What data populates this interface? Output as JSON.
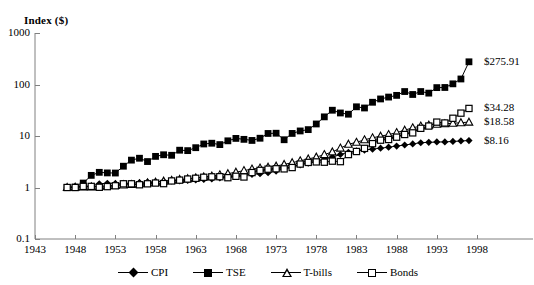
{
  "chart_data": {
    "type": "line",
    "title": "",
    "ylabel": "Index ($)",
    "xlabel": "",
    "log_y": true,
    "ylim": [
      0.1,
      1000
    ],
    "xlim": [
      1943,
      1998
    ],
    "ytick_labels": [
      "1000",
      "100",
      "10",
      "1",
      "0.1"
    ],
    "ytick_values": [
      1000,
      100,
      10,
      1,
      0.1
    ],
    "xtick_labels": [
      "1943",
      "1948",
      "1953",
      "1958",
      "1963",
      "1968",
      "1973",
      "1978",
      "1983",
      "1988",
      "1993",
      "1998"
    ],
    "xtick_values": [
      1943,
      1948,
      1953,
      1958,
      1963,
      1968,
      1973,
      1978,
      1983,
      1988,
      1993,
      1998
    ],
    "grid": false,
    "legend_position": "bottom",
    "x": [
      1947,
      1948,
      1949,
      1950,
      1951,
      1952,
      1953,
      1954,
      1955,
      1956,
      1957,
      1958,
      1959,
      1960,
      1961,
      1962,
      1963,
      1964,
      1965,
      1966,
      1967,
      1968,
      1969,
      1970,
      1971,
      1972,
      1973,
      1974,
      1975,
      1976,
      1977,
      1978,
      1979,
      1980,
      1981,
      1982,
      1983,
      1984,
      1985,
      1986,
      1987,
      1988,
      1989,
      1990,
      1991,
      1992,
      1993,
      1994,
      1995,
      1996,
      1997
    ],
    "series": [
      {
        "name": "CPI",
        "marker": "filled-diamond",
        "end_label": "$8.16",
        "end_value": 8.16,
        "values": [
          1.0,
          1.04,
          1.05,
          1.07,
          1.18,
          1.21,
          1.2,
          1.21,
          1.21,
          1.25,
          1.28,
          1.3,
          1.32,
          1.34,
          1.35,
          1.37,
          1.4,
          1.43,
          1.47,
          1.53,
          1.59,
          1.66,
          1.74,
          1.8,
          1.85,
          1.94,
          2.08,
          2.31,
          2.55,
          2.74,
          2.96,
          3.23,
          3.53,
          3.89,
          4.37,
          4.84,
          5.12,
          5.34,
          5.56,
          5.8,
          6.06,
          6.36,
          6.68,
          7.01,
          7.4,
          7.52,
          7.66,
          7.67,
          7.84,
          8.01,
          8.16
        ]
      },
      {
        "name": "TSE",
        "marker": "filled-square",
        "end_label": "$275.91",
        "end_value": 275.91,
        "values": [
          1.0,
          1.02,
          1.22,
          1.72,
          1.97,
          1.92,
          1.91,
          2.59,
          3.4,
          3.7,
          3.19,
          4.02,
          4.32,
          4.22,
          5.3,
          5.2,
          5.93,
          7.0,
          7.24,
          6.81,
          8.06,
          8.98,
          8.61,
          8.2,
          9.05,
          11.2,
          11.32,
          8.46,
          11.22,
          12.53,
          13.3,
          17.12,
          23.53,
          31.65,
          28.0,
          26.5,
          36.9,
          35.0,
          45.2,
          52.4,
          57.0,
          61.5,
          73.0,
          64.0,
          73.0,
          68.0,
          87.0,
          87.5,
          103.0,
          128.0,
          275.91
        ]
      },
      {
        "name": "T-bills",
        "marker": "open-triangle",
        "end_label": "$18.58",
        "end_value": 18.58,
        "values": [
          1.0,
          1.01,
          1.02,
          1.03,
          1.05,
          1.08,
          1.1,
          1.12,
          1.14,
          1.18,
          1.23,
          1.27,
          1.33,
          1.38,
          1.43,
          1.48,
          1.54,
          1.6,
          1.67,
          1.76,
          1.85,
          1.98,
          2.13,
          2.28,
          2.38,
          2.47,
          2.6,
          2.81,
          3.03,
          3.3,
          3.58,
          3.89,
          4.36,
          4.91,
          5.82,
          6.91,
          7.55,
          8.43,
          9.21,
          9.93,
          10.66,
          11.65,
          12.96,
          14.42,
          15.59,
          16.26,
          16.86,
          17.25,
          17.65,
          18.1,
          18.58
        ]
      },
      {
        "name": "Bonds",
        "marker": "open-square",
        "end_label": "$34.28",
        "end_value": 34.28,
        "values": [
          1.0,
          1.0,
          1.05,
          1.05,
          1.01,
          1.04,
          1.08,
          1.18,
          1.18,
          1.13,
          1.18,
          1.22,
          1.19,
          1.34,
          1.39,
          1.46,
          1.51,
          1.58,
          1.61,
          1.62,
          1.55,
          1.65,
          1.6,
          1.95,
          2.15,
          2.27,
          2.31,
          2.3,
          2.44,
          2.85,
          3.07,
          3.14,
          3.1,
          3.25,
          3.18,
          4.36,
          5.0,
          5.75,
          7.1,
          8.3,
          8.55,
          9.5,
          10.7,
          11.5,
          14.1,
          15.6,
          18.6,
          17.9,
          22.1,
          27.8,
          34.28
        ]
      }
    ]
  },
  "legend": {
    "items": [
      {
        "label": "CPI"
      },
      {
        "label": "TSE"
      },
      {
        "label": "T-bills"
      },
      {
        "label": "Bonds"
      }
    ]
  }
}
